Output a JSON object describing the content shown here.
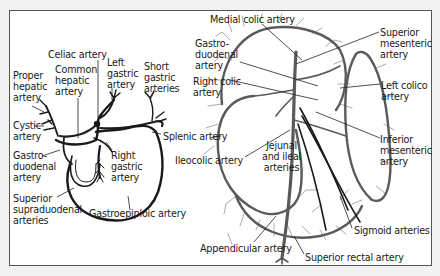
{
  "diagram": {
    "type": "anatomical-illustration",
    "panels": [
      {
        "name": "celiac-trunk-stomach",
        "labels": [
          {
            "id": "celiac",
            "text": "Celiac artery",
            "x": 48,
            "y": 49
          },
          {
            "id": "common_hepatic",
            "text": "Common\nhepatic\nartery",
            "x": 55,
            "y": 64
          },
          {
            "id": "left_gastric",
            "text": "Left\ngastric\nartery",
            "x": 107,
            "y": 57
          },
          {
            "id": "short_gastric",
            "text": "Short\ngastric\narteries",
            "x": 144,
            "y": 61
          },
          {
            "id": "proper_hepatic",
            "text": "Proper\nhepatic\nartery",
            "x": 13,
            "y": 70
          },
          {
            "id": "cystic",
            "text": "Cystic\nartery",
            "x": 13,
            "y": 120
          },
          {
            "id": "splenic",
            "text": "Splenic artery",
            "x": 163,
            "y": 131
          },
          {
            "id": "gastroduodenal_left",
            "text": "Gastro-\nduodenal\nartery",
            "x": 13,
            "y": 150
          },
          {
            "id": "right_gastric",
            "text": "Right\ngastric\nartery",
            "x": 111,
            "y": 150
          },
          {
            "id": "superior_supraduodenal",
            "text": "Superior\nsupraduodenal\narteries",
            "x": 13,
            "y": 193
          },
          {
            "id": "gastroepiploic",
            "text": "Gastroepiploic artery",
            "x": 89,
            "y": 208
          }
        ]
      },
      {
        "name": "mesenteric-intestine",
        "labels": [
          {
            "id": "medial_colic",
            "text": "Medial colic artery",
            "x": 210,
            "y": 14
          },
          {
            "id": "superior_mesenteric",
            "text": "Superior\nmesenteric\nartery",
            "x": 380,
            "y": 27
          },
          {
            "id": "gastroduodenal_right",
            "text": "Gastro-\nduodenal\nartery",
            "x": 195,
            "y": 38
          },
          {
            "id": "right_colic",
            "text": "Right colic\nartery",
            "x": 193,
            "y": 76
          },
          {
            "id": "left_colico",
            "text": "Left colico\nartery",
            "x": 381,
            "y": 80
          },
          {
            "id": "ileocolic",
            "text": "Ileocolic artery",
            "x": 175,
            "y": 155
          },
          {
            "id": "jejunal_ileal",
            "text": "Jejunal\nand ileal\narteries",
            "x": 262,
            "y": 140
          },
          {
            "id": "inferior_mesenteric",
            "text": "Inferior\nmesenteric\nartery",
            "x": 380,
            "y": 134
          },
          {
            "id": "sigmoid",
            "text": "Sigmoid arteries",
            "x": 354,
            "y": 225
          },
          {
            "id": "appendicular",
            "text": "Appendicular artery",
            "x": 200,
            "y": 243
          },
          {
            "id": "superior_rectal",
            "text": "Superior rectal artery",
            "x": 305,
            "y": 252
          }
        ]
      }
    ],
    "colors": {
      "background": "#f2f2f2",
      "frame_fill": "#ffffff",
      "frame_border": "#555555",
      "vessel_dark": "#1a1a1a",
      "vessel_gray": "#5a5a5a",
      "vessel_light": "#aaaaaa",
      "leader_line": "#222222",
      "text": "#1a1a1a"
    }
  }
}
